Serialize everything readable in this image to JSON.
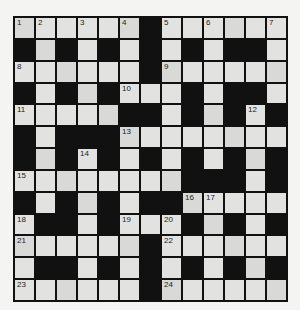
{
  "puzzle": {
    "rows": 13,
    "cols": 13,
    "layout": [
      "WWWWWWBWWWWWW",
      "BWBWBWBWBWBBW",
      "WWWWWWBWWWWWW",
      "BWBWBWWWBWBBW",
      "WWWWWBBWBWBWB",
      "BWBBBWWWWWWWW",
      "BWBWBWBWBWBWB",
      "WWWWWWWWBBBWB",
      "BWBWBWBBWWWWW",
      "WBBWBWWWBWBWB",
      "WWWWWWBWWWWWW",
      "WBBWBWBWBWBWB",
      "WWWWWWBWWWWWW"
    ],
    "numbers": [
      {
        "row": 0,
        "col": 0,
        "n": "1"
      },
      {
        "row": 0,
        "col": 1,
        "n": "2"
      },
      {
        "row": 0,
        "col": 3,
        "n": "3"
      },
      {
        "row": 0,
        "col": 5,
        "n": "4"
      },
      {
        "row": 0,
        "col": 7,
        "n": "5"
      },
      {
        "row": 0,
        "col": 9,
        "n": "6"
      },
      {
        "row": 0,
        "col": 12,
        "n": "7"
      },
      {
        "row": 2,
        "col": 0,
        "n": "8"
      },
      {
        "row": 2,
        "col": 7,
        "n": "9"
      },
      {
        "row": 3,
        "col": 5,
        "n": "10"
      },
      {
        "row": 4,
        "col": 0,
        "n": "11"
      },
      {
        "row": 4,
        "col": 11,
        "n": "12"
      },
      {
        "row": 5,
        "col": 5,
        "n": "13"
      },
      {
        "row": 6,
        "col": 3,
        "n": "14"
      },
      {
        "row": 7,
        "col": 0,
        "n": "15"
      },
      {
        "row": 8,
        "col": 8,
        "n": "16"
      },
      {
        "row": 8,
        "col": 9,
        "n": "17"
      },
      {
        "row": 9,
        "col": 0,
        "n": "18"
      },
      {
        "row": 9,
        "col": 5,
        "n": "19"
      },
      {
        "row": 9,
        "col": 7,
        "n": "20"
      },
      {
        "row": 10,
        "col": 0,
        "n": "21"
      },
      {
        "row": 10,
        "col": 7,
        "n": "22"
      },
      {
        "row": 12,
        "col": 0,
        "n": "23"
      },
      {
        "row": 12,
        "col": 7,
        "n": "24"
      }
    ],
    "colors": {
      "block": "#111111",
      "cell": "#e2e2e0",
      "background": "#f4f4f2"
    }
  }
}
